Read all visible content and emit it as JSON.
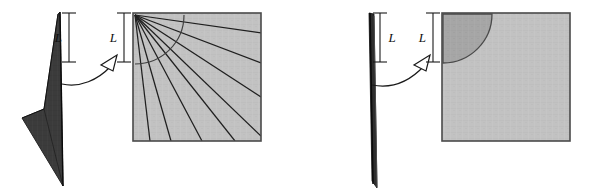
{
  "figure": {
    "background_color": "#ffffff",
    "width": 590,
    "height": 196,
    "panels": [
      {
        "id": "left",
        "name": "crumpled-fan-panel",
        "description": "Sharply folded sheet producing a fan of crease rays inside a square patch",
        "paper": {
          "name": "folded-paper-shape",
          "fill": "#3a3a3a",
          "stroke": "#111111",
          "points": "60,12 63,186 22,118 44,109 58,14"
        },
        "dimension": {
          "name": "length-marker-L",
          "label": "L",
          "label_text": "L",
          "x": 69,
          "y_top": 13,
          "y_bottom": 62,
          "cap_half_width": 7,
          "color": "#1a1a1a"
        },
        "arrow": {
          "name": "transfer-arrow",
          "path": "M 62,84 C 80,88 98,80 111,66",
          "head": "110,56 116,69 101,68",
          "color": "#1a1a1a"
        },
        "square": {
          "name": "patch-square",
          "x": 133,
          "y": 13,
          "size": 128,
          "fill": "#c2c2c2",
          "stroke": "#4a4a4a"
        },
        "dimension2": {
          "name": "length-marker-L-square",
          "label": "L",
          "label_text": "L",
          "x": 124,
          "y_top": 13,
          "y_bottom": 62,
          "cap_half_width": 7,
          "color": "#1a1a1a"
        },
        "rays": {
          "name": "crease-ray-set",
          "count": 8,
          "origin_x": 135,
          "origin_y": 15,
          "color": "#1f1f1f",
          "angles_deg": [
            8,
            21,
            33,
            44,
            55,
            65,
            74,
            83
          ],
          "endpoints": [
            {
              "x": 261,
              "y": 33
            },
            {
              "x": 261,
              "y": 63
            },
            {
              "x": 261,
              "y": 97
            },
            {
              "x": 261,
              "y": 136
            },
            {
              "x": 235,
              "y": 141
            },
            {
              "x": 202,
              "y": 141
            },
            {
              "x": 171,
              "y": 141
            },
            {
              "x": 150,
              "y": 141
            }
          ]
        },
        "arc": {
          "name": "radius-arc",
          "radius": 49,
          "center_x": 135,
          "center_y": 15,
          "color": "#3a3a3a"
        }
      },
      {
        "id": "right",
        "name": "smooth-cone-panel",
        "description": "Flat sheet producing a smooth quarter-circle conical region inside a square patch",
        "paper": {
          "name": "flat-paper-shape",
          "fill": "#2e2e2e",
          "stroke": "#111111",
          "points": "369,13 374,13 376,188 371,182"
        },
        "dimension": {
          "name": "length-marker-L",
          "label": "L",
          "label_text": "L",
          "x": 380,
          "y_top": 13,
          "y_bottom": 62,
          "cap_half_width": 7,
          "color": "#1a1a1a"
        },
        "arrow": {
          "name": "transfer-arrow",
          "path": "M 372,85 C 392,89 410,81 424,66",
          "head": "423,56 429,69 414,68",
          "color": "#1a1a1a"
        },
        "square": {
          "name": "patch-square",
          "x": 442,
          "y": 13,
          "size": 128,
          "fill": "#c2c2c2",
          "stroke": "#4a4a4a"
        },
        "dimension2": {
          "name": "length-marker-L-square",
          "label": "L",
          "label_text": "L",
          "x": 433,
          "y_top": 13,
          "y_bottom": 62,
          "cap_half_width": 7,
          "color": "#1a1a1a"
        },
        "quarter_circle": {
          "name": "cone-quarter-circle",
          "center_x": 443,
          "center_y": 14,
          "radius": 49,
          "fill": "#a6a6a6",
          "stroke": "#4a4a4a"
        }
      }
    ]
  }
}
